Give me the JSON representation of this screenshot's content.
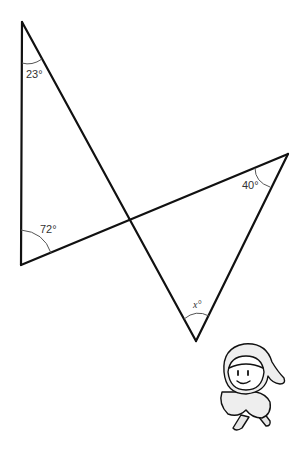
{
  "diagram": {
    "type": "two-triangles-vertical-angles",
    "angles": {
      "top_left": "23°",
      "bottom_left": "72°",
      "right": "40°",
      "bottom": "x°"
    },
    "unknown_label": "x",
    "degree_symbol": "°",
    "vertices": {
      "A_top": [
        22,
        22
      ],
      "B_bottom_left": [
        21,
        265
      ],
      "C_right": [
        288,
        154
      ],
      "D_bottom": [
        196,
        341
      ],
      "O_intersection": [
        130,
        219
      ]
    },
    "line_color": "#111111",
    "arc_color": "#555555",
    "mascot": "hooded-character-icon"
  }
}
